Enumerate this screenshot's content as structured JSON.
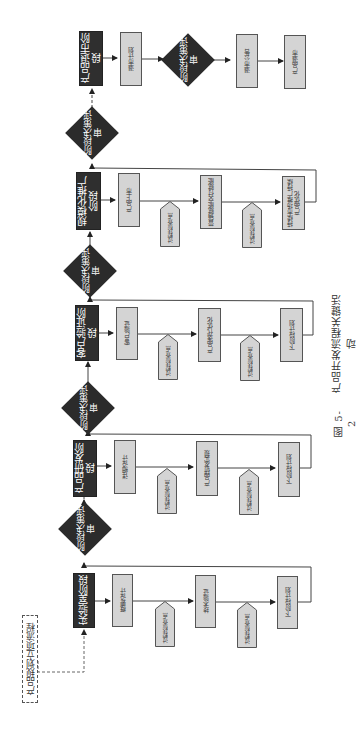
{
  "caption": {
    "figure_number": "图 5-2",
    "title": "产品开发流程关键活动"
  },
  "entry": {
    "label": "产品规划立项流程"
  },
  "decision_label": "阶段决策评审",
  "stages": [
    {
      "name": "实验室阶段",
      "tasks": [
        "概要设计",
        "技术验证",
        "下阶段计划"
      ],
      "checkpoints": [
        "过程检查点",
        "过程检查点"
      ]
    },
    {
      "name": "产品研发阶段",
      "tasks": [
        "详细设计",
        "产品研发实现",
        "下阶段计划"
      ],
      "checkpoints": [
        "过程检查点",
        "过程检查点"
      ]
    },
    {
      "name": "客户验证阶段",
      "tasks": [
        "客户验证",
        "产品迭代优化",
        "下阶段计划"
      ],
      "checkpoints": [
        "过程检查点",
        "过程检查点"
      ]
    },
    {
      "name": "规模化推广阶段",
      "tasks": [
        "产品上市",
        "营销赋能交付赋能",
        "持续市场推广持续产品优化"
      ],
      "checkpoints": [
        "过程检查点",
        "过程检查点"
      ]
    },
    {
      "name": "产品退市阶段",
      "tasks": [
        "退市计划",
        "退市公告",
        "产品退市"
      ],
      "decision": "阶段决策评审"
    }
  ],
  "colors": {
    "stage_fill": "#2f2f2f",
    "task_fill": "#d4d4d4",
    "line": "#444444"
  }
}
